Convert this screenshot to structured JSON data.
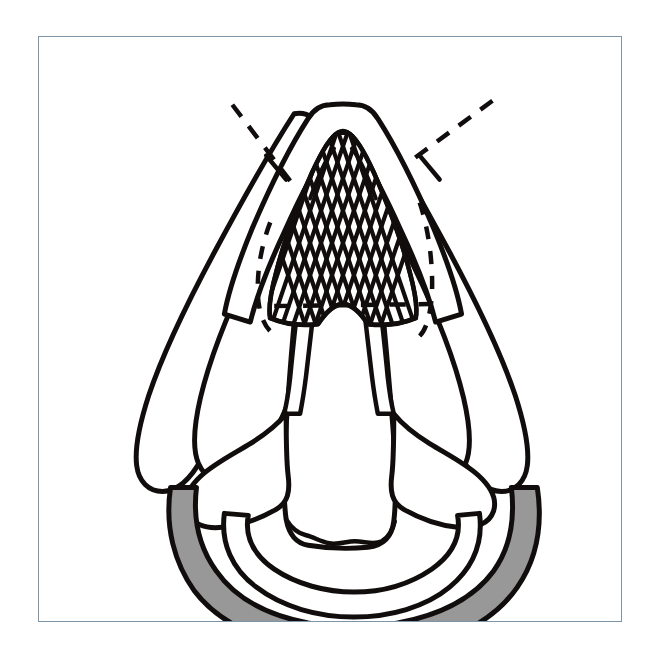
{
  "figure": {
    "domain": "anatomical-line-drawing",
    "title": "Superior laryngoscopic view of the larynx",
    "background_color": "#ffffff",
    "frame": {
      "border_color": "#7d95a8",
      "border_width_px": 1.4,
      "x": 38,
      "y": 36,
      "width": 584,
      "height": 586
    },
    "palette": {
      "ink": "#100d0c",
      "shade_gray": "#989898",
      "paper": "#ffffff",
      "frame_blue": "#7d95a8"
    },
    "line_style": {
      "outline_weight_px": 5,
      "thin_weight_px": 3.5,
      "hatch_weight_px": 4,
      "dash_weight_px": 4,
      "dash_pattern": "14 11"
    },
    "parts": [
      {
        "id": "epiglottis-outline",
        "name": "epiglottis-outer-outline",
        "description": "Large inverted-V outer contour forming the apex of the figure",
        "shade": "#ffffff"
      },
      {
        "id": "epiglottis-inner",
        "name": "epiglottis-inner-outline",
        "description": "Second inner contour nested inside the outer epiglottic arch",
        "shade": "#ffffff"
      },
      {
        "id": "hatched-field",
        "name": "cross-hatched-region",
        "description": "Cross-hatched lattice filling the inner epiglottic arch",
        "hatch_sets": 2,
        "hatch_count_left": 11,
        "hatch_count_right": 10
      },
      {
        "id": "aryepiglottic-fold-left",
        "name": "aryepiglottic-fold-left",
        "description": "Elongated left lateral wing extending inferolaterally",
        "shade": "#ffffff"
      },
      {
        "id": "aryepiglottic-fold-right",
        "name": "aryepiglottic-fold-right",
        "description": "Elongated right lateral wing extending inferolaterally",
        "shade": "#ffffff"
      },
      {
        "id": "outer-wing-left",
        "name": "outer-wing-left",
        "description": "Outermost slender left lobe reaching the lower-left quadrant",
        "shade": "#ffffff"
      },
      {
        "id": "outer-wing-right",
        "name": "outer-wing-right",
        "description": "Outermost slender right lobe reaching the lower-right quadrant",
        "shade": "#ffffff"
      },
      {
        "id": "vocal-cord-left",
        "name": "vocal-cord-left",
        "description": "Left vertical band descending from the arytenoid toward the glottis",
        "shade": "#ffffff"
      },
      {
        "id": "vocal-cord-right",
        "name": "vocal-cord-right",
        "description": "Right vertical band descending from the arytenoid toward the glottis",
        "shade": "#ffffff"
      },
      {
        "id": "arytenoid-left",
        "name": "arytenoid-cartilage-left",
        "description": "Left lobed cartilage body at the base of the vocal cord",
        "shade": "#ffffff"
      },
      {
        "id": "arytenoid-right",
        "name": "arytenoid-cartilage-right",
        "description": "Right lobed cartilage body at the base of the vocal cord",
        "shade": "#ffffff"
      },
      {
        "id": "posterior-wall",
        "name": "posterior-pharyngeal-wall",
        "description": "Broad central body between the cords terminating in a wavy inferior edge",
        "shade": "#ffffff"
      },
      {
        "id": "inner-crescent",
        "name": "inner-crescent-band",
        "description": "Unshaded crescent arc nested inside the shaded ring",
        "shade": "#ffffff"
      },
      {
        "id": "cricoid-ring",
        "name": "cricoid-ring-shaded",
        "description": "Outer crescent band filled with solid gray shading",
        "shade": "#989898"
      }
    ],
    "annotations": [
      {
        "id": "dash-line-left",
        "name": "dashed-indicator-left",
        "style": "dashed",
        "orientation": "diagonal descending to the right",
        "from": {
          "x": 232,
          "y": 103
        },
        "to": {
          "x": 291,
          "y": 182
        }
      },
      {
        "id": "dash-line-right",
        "name": "dashed-indicator-right",
        "style": "dashed",
        "orientation": "diagonal descending to the left",
        "from": {
          "x": 492,
          "y": 100
        },
        "to": {
          "x": 408,
          "y": 160
        }
      },
      {
        "id": "dashed-oval-left",
        "name": "dashed-contour-left",
        "style": "dashed",
        "description": "Dashed curve tracing the hidden left margin of the inner structure"
      },
      {
        "id": "dashed-oval-right",
        "name": "dashed-contour-right",
        "style": "dashed",
        "description": "Dashed curve tracing the hidden right margin of the inner structure"
      },
      {
        "id": "dashed-transverse",
        "name": "dashed-transverse-line",
        "style": "dashed",
        "description": "Horizontal dashed line crossing the central body",
        "from": {
          "x": 285,
          "y": 304
        },
        "to": {
          "x": 400,
          "y": 303
        }
      }
    ]
  }
}
